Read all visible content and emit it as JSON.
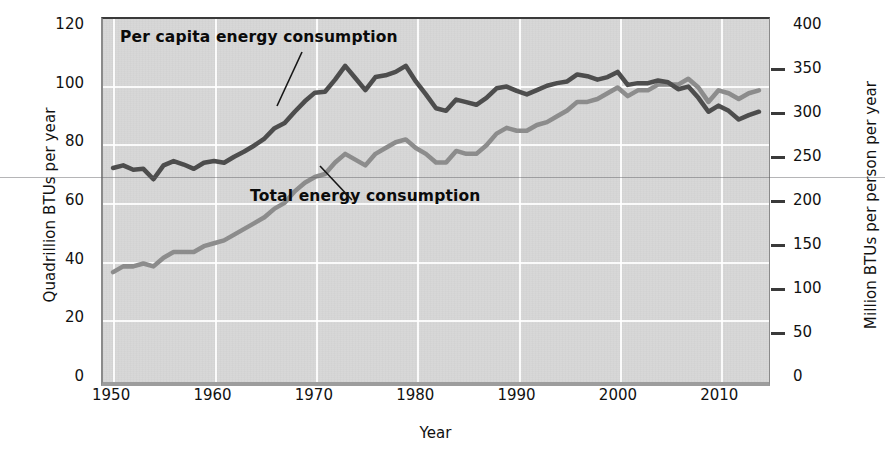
{
  "chart_data": {
    "type": "line",
    "title": "",
    "xlabel": "Year",
    "ylabel": "Quadrillion BTUs per year",
    "ylabel_right": "Million BTUs per person per year",
    "xlim": [
      1949,
      2015
    ],
    "ylim": [
      0,
      120
    ],
    "ylim_right": [
      0,
      400
    ],
    "grid": true,
    "legend_position": "inline-annotations",
    "xticks": [
      1950,
      1960,
      1970,
      1980,
      1990,
      2000,
      2010
    ],
    "yticks_left": [
      0,
      20,
      40,
      60,
      80,
      100,
      120
    ],
    "yticks_right": [
      0,
      50,
      100,
      150,
      200,
      250,
      300,
      350,
      400
    ],
    "annotations": [
      {
        "text": "Per capita energy consumption",
        "series": "Per capita energy consumption",
        "points_to_year": 1968
      },
      {
        "text": "Total energy consumption",
        "series": "Total energy consumption",
        "points_to_year": 1973
      }
    ],
    "x": [
      1950,
      1951,
      1952,
      1953,
      1954,
      1955,
      1956,
      1957,
      1958,
      1959,
      1960,
      1961,
      1962,
      1963,
      1964,
      1965,
      1966,
      1967,
      1968,
      1969,
      1970,
      1971,
      1972,
      1973,
      1974,
      1975,
      1976,
      1977,
      1978,
      1979,
      1980,
      1981,
      1982,
      1983,
      1984,
      1985,
      1986,
      1987,
      1988,
      1989,
      1990,
      1991,
      1992,
      1993,
      1994,
      1995,
      1996,
      1997,
      1998,
      1999,
      2000,
      2001,
      2002,
      2003,
      2004,
      2005,
      2006,
      2007,
      2008,
      2009,
      2010,
      2011,
      2012,
      2013,
      2014
    ],
    "series": [
      {
        "name": "Per capita energy consumption",
        "axis": "right",
        "units": "Million BTUs per person per year",
        "color": "#4d4d4d",
        "values": [
          237,
          240,
          235,
          236,
          224,
          240,
          245,
          241,
          236,
          243,
          245,
          243,
          250,
          256,
          263,
          271,
          283,
          289,
          302,
          314,
          324,
          325,
          339,
          355,
          341,
          327,
          342,
          344,
          348,
          355,
          337,
          322,
          306,
          303,
          316,
          313,
          310,
          318,
          329,
          331,
          326,
          322,
          327,
          332,
          335,
          337,
          345,
          343,
          339,
          342,
          348,
          333,
          335,
          335,
          338,
          336,
          328,
          331,
          318,
          302,
          309,
          303,
          293,
          298,
          302
        ]
      },
      {
        "name": "Total energy consumption",
        "axis": "left",
        "units": "Quadrillion BTUs per year",
        "color": "#8c8c8c",
        "values": [
          35,
          37,
          37,
          38,
          37,
          40,
          42,
          42,
          42,
          44,
          45,
          46,
          48,
          50,
          52,
          54,
          57,
          59,
          63,
          66,
          68,
          69,
          73,
          76,
          74,
          72,
          76,
          78,
          80,
          81,
          78,
          76,
          73,
          73,
          77,
          76,
          76,
          79,
          83,
          85,
          84,
          84,
          86,
          87,
          89,
          91,
          94,
          94,
          95,
          97,
          99,
          96,
          98,
          98,
          100,
          100,
          100,
          102,
          99,
          94,
          98,
          97,
          95,
          97,
          98
        ]
      }
    ]
  },
  "axes": {
    "left": {
      "title": "Quadrillion BTUs per year",
      "ticks": [
        "120",
        "100",
        "80",
        "60",
        "40",
        "20",
        "0"
      ]
    },
    "right": {
      "title": "Million BTUs per person per year",
      "ticks": [
        "400",
        "350",
        "300",
        "250",
        "200",
        "150",
        "100",
        "50",
        "0"
      ]
    },
    "x": {
      "title": "Year",
      "ticks": [
        "1950",
        "1960",
        "1970",
        "1980",
        "1990",
        "2000",
        "2010"
      ]
    }
  },
  "annotations": {
    "per_capita": "Per capita energy consumption",
    "total": "Total energy consumption"
  },
  "colors": {
    "per_capita_line": "#4d4d4d",
    "total_line": "#8c8c8c",
    "plot_background": "#d7d7d7",
    "gridline": "#ffffff",
    "text": "#111111"
  }
}
